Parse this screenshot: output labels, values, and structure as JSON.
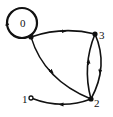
{
  "diagram": {
    "type": "directed-graph",
    "nodes": [
      {
        "id": "0",
        "label": "0",
        "has_self_loop": true
      },
      {
        "id": "1",
        "label": "1"
      },
      {
        "id": "2",
        "label": "2"
      },
      {
        "id": "3",
        "label": "3"
      }
    ],
    "edges": [
      {
        "from": "0",
        "to": "0"
      },
      {
        "from": "0",
        "to": "3"
      },
      {
        "from": "0",
        "to": "2"
      },
      {
        "from": "3",
        "to": "2"
      },
      {
        "from": "2",
        "to": "3"
      },
      {
        "from": "2",
        "to": "1"
      }
    ],
    "colors": {
      "stroke": "#111111",
      "background": "#ffffff"
    }
  }
}
